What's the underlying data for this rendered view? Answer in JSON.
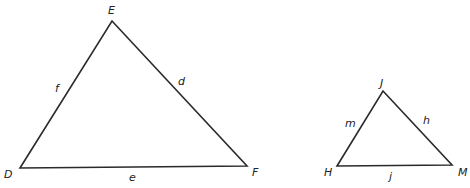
{
  "triangles": [
    {
      "name": "DEF",
      "vertices": {
        "D": {
          "label": "D",
          "x": 20,
          "y": 168,
          "lx": 4,
          "ly": 178
        },
        "E": {
          "label": "E",
          "x": 112,
          "y": 21,
          "lx": 108,
          "ly": 14
        },
        "F": {
          "label": "F",
          "x": 247,
          "y": 166,
          "lx": 252,
          "ly": 176
        }
      },
      "sides": {
        "d": {
          "label": "d",
          "lx": 178,
          "ly": 85
        },
        "e": {
          "label": "e",
          "lx": 129,
          "ly": 181
        },
        "f": {
          "label": "f",
          "lx": 55,
          "ly": 92
        }
      }
    },
    {
      "name": "HJM",
      "vertices": {
        "H": {
          "label": "H",
          "x": 337,
          "y": 166,
          "lx": 324,
          "ly": 176
        },
        "J": {
          "label": "J",
          "x": 383,
          "y": 91,
          "lx": 380,
          "ly": 87
        },
        "M": {
          "label": "M",
          "x": 452,
          "y": 165,
          "lx": 458,
          "ly": 176
        }
      },
      "sides": {
        "h": {
          "label": "h",
          "lx": 423,
          "ly": 124
        },
        "j": {
          "label": "j",
          "lx": 389,
          "ly": 180
        },
        "m": {
          "label": "m",
          "lx": 345,
          "ly": 127
        }
      }
    }
  ],
  "colors": {
    "stroke": "#2a2a2a",
    "text": "#222222",
    "background": "#ffffff"
  }
}
